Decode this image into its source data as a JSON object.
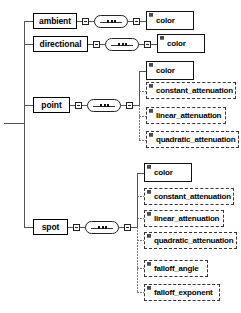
{
  "diagram": {
    "type": "xml-schema-tree",
    "root_connector": "root-stub",
    "symbols": {
      "sequence_label": "sequence",
      "toggle_label": "collapse",
      "attribute_marker_label": "attribute"
    },
    "branches": [
      {
        "id": "ambient",
        "label": "ambient",
        "occurrence": "solid",
        "children": [
          {
            "id": "ambient-color",
            "label": "color",
            "occurrence": "solid"
          }
        ]
      },
      {
        "id": "directional",
        "label": "directional",
        "occurrence": "solid",
        "children": [
          {
            "id": "directional-color",
            "label": "color",
            "occurrence": "solid"
          }
        ]
      },
      {
        "id": "point",
        "label": "point",
        "occurrence": "solid",
        "children": [
          {
            "id": "point-color",
            "label": "color",
            "occurrence": "solid"
          },
          {
            "id": "point-constant-attenuation",
            "label": "constant_attenuation",
            "occurrence": "dashed"
          },
          {
            "id": "point-linear-attenuation",
            "label": "linear_attenuation",
            "occurrence": "dashed"
          },
          {
            "id": "point-quadratic-attenuation",
            "label": "quadratic_attenuation",
            "occurrence": "dashed"
          }
        ]
      },
      {
        "id": "spot",
        "label": "spot",
        "occurrence": "solid",
        "children": [
          {
            "id": "spot-color",
            "label": "color",
            "occurrence": "solid"
          },
          {
            "id": "spot-constant-attenuation",
            "label": "constant_attenuation",
            "occurrence": "dashed"
          },
          {
            "id": "spot-linear-attenuation",
            "label": "linear_attenuation",
            "occurrence": "dashed"
          },
          {
            "id": "spot-quadratic-attenuation",
            "label": "quadratic_attenuation",
            "occurrence": "dashed"
          },
          {
            "id": "spot-falloff-angle",
            "label": "falloff_angle",
            "occurrence": "dashed"
          },
          {
            "id": "spot-falloff-exponent",
            "label": "falloff_exponent",
            "occurrence": "dashed"
          }
        ]
      }
    ],
    "colors": {
      "line": "#555555",
      "box_border": "#111111",
      "optional_border": "#333333",
      "text": "#000000",
      "background": "#ffffff"
    }
  }
}
